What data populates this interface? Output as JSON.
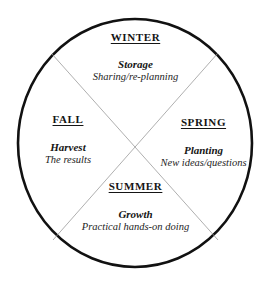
{
  "diagram": {
    "shape": "circle",
    "divider": "x-cross",
    "colors": {
      "background": "#ffffff",
      "circle_stroke": "#111111",
      "divider_stroke": "#9a9a9a",
      "text": "#151515"
    },
    "geometry": {
      "center_x": 135,
      "center_y": 143,
      "radius_x": 118,
      "radius_y": 124,
      "circle_stroke_width": 2.6,
      "divider_stroke_width": 0.7
    },
    "quadrants": [
      {
        "id": "winter",
        "position": "top",
        "season": "WINTER",
        "keyword": "Storage",
        "description": "Sharing/re-planning"
      },
      {
        "id": "spring",
        "position": "right",
        "season": "SPRING",
        "keyword": "Planting",
        "description": "New ideas/questions"
      },
      {
        "id": "summer",
        "position": "bottom",
        "season": "SUMMER",
        "keyword": "Growth",
        "description": "Practical hands-on doing"
      },
      {
        "id": "fall",
        "position": "left",
        "season": "FALL",
        "keyword": "Harvest",
        "description": "The results"
      }
    ]
  }
}
